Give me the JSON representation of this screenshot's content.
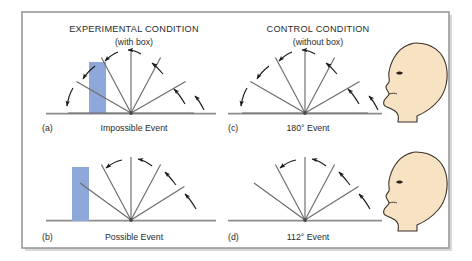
{
  "figure": {
    "frame": {
      "border_color": "#9a9a9a",
      "background_color": "#ffffff",
      "page_background": "#ffffff"
    },
    "colors": {
      "box_fill": "#8ea8da",
      "box_stroke": "#8ea8da",
      "line_stroke": "#6b6b6b",
      "baseline_stroke": "#8c8c8c",
      "arrow_stroke": "#1a1a1a",
      "head_fill": "#f7e3c3",
      "head_stroke": "#3a3028",
      "text_color": "#2b2b2b"
    },
    "headings": [
      {
        "id": "experimental",
        "title": "EXPERIMENTAL CONDITION",
        "subtitle": "(with box)"
      },
      {
        "id": "control",
        "title": "CONTROL CONDITION",
        "subtitle": "(without box)"
      }
    ],
    "panels": [
      {
        "id": "a",
        "letter": "(a)",
        "caption": "Impossible Event",
        "caption_degrees": "",
        "condition": "experimental",
        "has_box": true,
        "has_head": false,
        "sweep_label": "180",
        "fan_angles_deg": [
          0,
          30,
          62,
          90,
          118,
          150,
          180
        ],
        "arrow_count": 4
      },
      {
        "id": "b",
        "letter": "(b)",
        "caption": "Possible Event",
        "caption_degrees": "",
        "condition": "experimental",
        "has_box": true,
        "has_head": false,
        "sweep_label": "112",
        "fan_angles_deg": [
          32,
          62,
          90,
          118,
          144
        ],
        "arrow_count": 4
      },
      {
        "id": "c",
        "letter": "(c)",
        "caption": "180° Event",
        "caption_value": "180",
        "caption_unit": "°",
        "caption_suffix": " Event",
        "condition": "control",
        "has_box": false,
        "has_head": true,
        "sweep_label": "180",
        "fan_angles_deg": [
          0,
          30,
          62,
          90,
          118,
          150,
          180
        ],
        "arrow_count": 4
      },
      {
        "id": "d",
        "letter": "(d)",
        "caption": "112° Event",
        "caption_value": "112",
        "caption_unit": "°",
        "caption_suffix": " Event",
        "condition": "control",
        "has_box": false,
        "has_head": true,
        "sweep_label": "112",
        "fan_angles_deg": [
          32,
          62,
          90,
          118,
          144
        ],
        "arrow_count": 4
      }
    ],
    "observers": [
      {
        "id": "head-top",
        "label": "infant-head-profile",
        "facing": "left"
      },
      {
        "id": "head-bottom",
        "label": "infant-head-profile",
        "facing": "left"
      }
    ]
  }
}
